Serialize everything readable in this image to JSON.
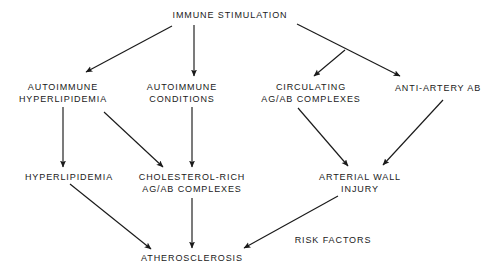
{
  "diagram": {
    "title": "IMMUNE STIMULATION",
    "background_color": "#ffffff",
    "stroke_color": "#1a1a1a",
    "nodes": [
      {
        "id": "immune-stimulation",
        "lines": [
          "IMMUNE STIMULATION"
        ],
        "x": 230,
        "y": 15
      },
      {
        "id": "autoimmune-hyperlipidemia",
        "lines": [
          "AUTOIMMUNE",
          "HYPERLIPIDEMIA"
        ],
        "x": 63,
        "y": 93
      },
      {
        "id": "autoimmune-conditions",
        "lines": [
          "AUTOIMMUNE",
          "CONDITIONS"
        ],
        "x": 182,
        "y": 93
      },
      {
        "id": "circulating-ag-ab-complexes",
        "lines": [
          "CIRCULATING",
          "AG/AB COMPLEXES"
        ],
        "x": 311,
        "y": 93
      },
      {
        "id": "anti-artery-ab",
        "lines": [
          "ANTI-ARTERY AB"
        ],
        "x": 438,
        "y": 88
      },
      {
        "id": "hyperlipidemia",
        "lines": [
          "HYPERLIPIDEMIA"
        ],
        "x": 69,
        "y": 177
      },
      {
        "id": "cholesterol-rich-ag-ab-complexes",
        "lines": [
          "CHOLESTEROL-RICH",
          "AG/AB COMPLEXES"
        ],
        "x": 192,
        "y": 183
      },
      {
        "id": "arterial-wall-injury",
        "lines": [
          "ARTERIAL WALL",
          "INJURY"
        ],
        "x": 360,
        "y": 183
      },
      {
        "id": "atherosclerosis",
        "lines": [
          "ATHEROSCLEROSIS"
        ],
        "x": 192,
        "y": 258
      }
    ],
    "edge_labels": [
      {
        "id": "risk-factors",
        "text": "RISK FACTORS",
        "x": 333,
        "y": 240
      }
    ],
    "edges": [
      {
        "id": "immune-to-autoimmune-hyperlipidemia",
        "from": "immune-stimulation",
        "to": "autoimmune-hyperlipidemia",
        "x1": 172,
        "y1": 26,
        "x2": 86,
        "y2": 72
      },
      {
        "id": "immune-to-autoimmune-conditions",
        "from": "immune-stimulation",
        "to": "autoimmune-conditions",
        "x1": 194,
        "y1": 25,
        "x2": 194,
        "y2": 76
      },
      {
        "id": "immune-to-anti-artery-ab",
        "from": "immune-stimulation",
        "to": "anti-artery-ab",
        "x1": 297,
        "y1": 24,
        "x2": 400,
        "y2": 76
      },
      {
        "id": "immune-to-circulating-complexes",
        "from": "immune-stimulation",
        "to": "circulating-ag-ab-complexes",
        "x1": 345,
        "y1": 50,
        "x2": 314,
        "y2": 76
      },
      {
        "id": "autoimmune-hyperlipidemia-to-hyperlipidemia",
        "from": "autoimmune-hyperlipidemia",
        "to": "hyperlipidemia",
        "x1": 63,
        "y1": 107,
        "x2": 63,
        "y2": 167
      },
      {
        "id": "autoimmune-hyperlipidemia-to-cholesterol-rich",
        "from": "autoimmune-hyperlipidemia",
        "to": "cholesterol-rich-ag-ab-complexes",
        "x1": 104,
        "y1": 112,
        "x2": 163,
        "y2": 167
      },
      {
        "id": "autoimmune-conditions-to-cholesterol-rich",
        "from": "autoimmune-conditions",
        "to": "cholesterol-rich-ag-ab-complexes",
        "x1": 192,
        "y1": 107,
        "x2": 192,
        "y2": 167
      },
      {
        "id": "circulating-complexes-to-arterial-wall",
        "from": "circulating-ag-ab-complexes",
        "to": "arterial-wall-injury",
        "x1": 298,
        "y1": 108,
        "x2": 348,
        "y2": 166
      },
      {
        "id": "anti-artery-ab-to-arterial-wall",
        "from": "anti-artery-ab",
        "to": "arterial-wall-injury",
        "x1": 443,
        "y1": 100,
        "x2": 383,
        "y2": 165
      },
      {
        "id": "hyperlipidemia-to-atherosclerosis",
        "from": "hyperlipidemia",
        "to": "atherosclerosis",
        "x1": 70,
        "y1": 184,
        "x2": 151,
        "y2": 249
      },
      {
        "id": "cholesterol-rich-to-atherosclerosis",
        "from": "cholesterol-rich-ag-ab-complexes",
        "to": "atherosclerosis",
        "x1": 192,
        "y1": 198,
        "x2": 192,
        "y2": 248
      },
      {
        "id": "arterial-wall-to-atherosclerosis",
        "from": "arterial-wall-injury",
        "to": "atherosclerosis",
        "x1": 338,
        "y1": 196,
        "x2": 244,
        "y2": 248
      }
    ]
  }
}
